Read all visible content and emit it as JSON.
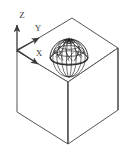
{
  "figure": {
    "background_color": "#ffffff",
    "line_color": "#555555",
    "mesh_color": "#222222",
    "axis_color": "#3a3a3a"
  },
  "axes": {
    "origin": {
      "x": 17,
      "y": 50
    },
    "items": [
      {
        "name": "z-axis",
        "label": "Z",
        "label_x": 22,
        "label_y": 15,
        "tip_x": 17,
        "tip_y": 23
      },
      {
        "name": "y-axis",
        "label": "Y",
        "label_x": 38,
        "label_y": 28,
        "tip_x": 41,
        "tip_y": 40
      },
      {
        "name": "x-axis",
        "label": "X",
        "label_x": 39,
        "label_y": 54,
        "tip_x": 40,
        "tip_y": 66
      }
    ]
  },
  "cube": {
    "name": "isometric-cube",
    "vertices": {
      "top": {
        "x": 72,
        "y": 18
      },
      "left_top": {
        "x": 17,
        "y": 51
      },
      "right_top": {
        "x": 118,
        "y": 48
      },
      "front_top": {
        "x": 68,
        "y": 82
      },
      "left_bottom": {
        "x": 17,
        "y": 112
      },
      "right_bottom": {
        "x": 118,
        "y": 110
      },
      "front_bottom": {
        "x": 68,
        "y": 144
      }
    }
  },
  "dome": {
    "name": "geodesic-dome",
    "center_x": 69,
    "center_y": 58,
    "radius_x": 19,
    "radius_y": 19,
    "base_ellipse_ry": 7,
    "meridians": 12,
    "parallels": 4
  }
}
